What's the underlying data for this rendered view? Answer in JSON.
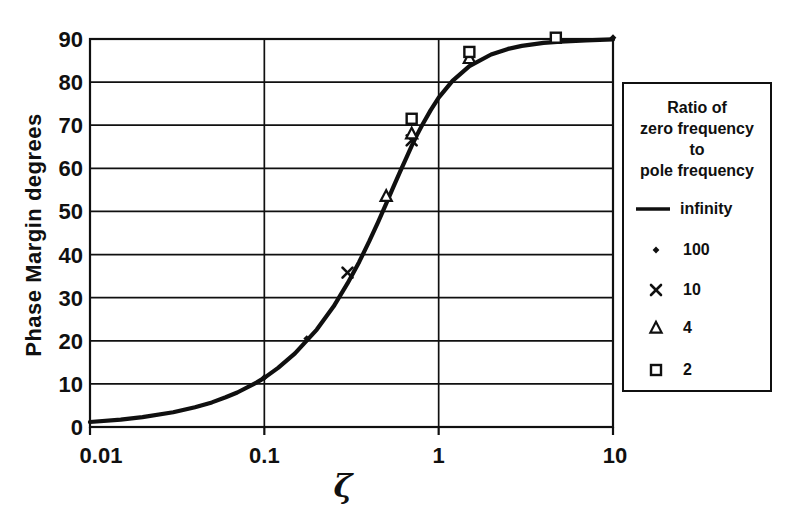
{
  "figure": {
    "background": "#ffffff",
    "ink": "#101010"
  },
  "y_axis": {
    "title": "Phase Margin degrees",
    "tick_labels": [
      "0",
      "10",
      "20",
      "30",
      "40",
      "50",
      "60",
      "70",
      "80",
      "90"
    ],
    "min": 0,
    "max": 90
  },
  "x_axis": {
    "title": "ζ",
    "tick_labels": [
      "0.01",
      "0.1",
      "1",
      "10"
    ],
    "scale": "log",
    "min": 0.01,
    "max": 10
  },
  "legend": {
    "title_lines": [
      "Ratio of",
      "zero frequency",
      "to",
      "pole frequency"
    ],
    "entries": [
      {
        "marker": "line",
        "label": "infinity"
      },
      {
        "marker": "dot",
        "label": "100"
      },
      {
        "marker": "cross",
        "label": "10"
      },
      {
        "marker": "triangle",
        "label": "4"
      },
      {
        "marker": "square",
        "label": "2"
      }
    ]
  },
  "chart_data": {
    "type": "line",
    "title": "",
    "xlabel": "ζ",
    "ylabel": "Phase Margin degrees",
    "x_scale": "log",
    "xlim": [
      0.01,
      10
    ],
    "ylim": [
      0,
      90
    ],
    "x_ticks": [
      0.01,
      0.1,
      1,
      10
    ],
    "y_ticks": [
      0,
      10,
      20,
      30,
      40,
      50,
      60,
      70,
      80,
      90
    ],
    "grid": true,
    "legend_position": "right",
    "series": [
      {
        "name": "infinity",
        "type": "line",
        "marker": "none",
        "points": [
          [
            0.01,
            1.15
          ],
          [
            0.015,
            1.7
          ],
          [
            0.02,
            2.3
          ],
          [
            0.03,
            3.4
          ],
          [
            0.04,
            4.6
          ],
          [
            0.05,
            5.7
          ],
          [
            0.06,
            6.9
          ],
          [
            0.07,
            8.0
          ],
          [
            0.09,
            10.3
          ],
          [
            0.1,
            11.4
          ],
          [
            0.12,
            13.7
          ],
          [
            0.15,
            17.1
          ],
          [
            0.2,
            22.6
          ],
          [
            0.25,
            28.0
          ],
          [
            0.3,
            33.3
          ],
          [
            0.35,
            38.3
          ],
          [
            0.4,
            43.1
          ],
          [
            0.45,
            47.6
          ],
          [
            0.5,
            51.8
          ],
          [
            0.55,
            55.7
          ],
          [
            0.6,
            59.2
          ],
          [
            0.65,
            62.3
          ],
          [
            0.7,
            65.2
          ],
          [
            0.75,
            67.7
          ],
          [
            0.8,
            69.9
          ],
          [
            0.9,
            73.5
          ],
          [
            1.0,
            76.4
          ],
          [
            1.2,
            80.3
          ],
          [
            1.5,
            83.7
          ],
          [
            2,
            86.4
          ],
          [
            2.5,
            87.7
          ],
          [
            3,
            88.4
          ],
          [
            4,
            89.1
          ],
          [
            5,
            89.4
          ],
          [
            7,
            89.7
          ],
          [
            10,
            89.9
          ]
        ]
      },
      {
        "name": "100",
        "type": "scatter",
        "marker": "dot",
        "points": [
          [
            0.1,
            11.5
          ],
          [
            0.175,
            20.5
          ],
          [
            10,
            90.3
          ]
        ]
      },
      {
        "name": "10",
        "type": "scatter",
        "marker": "cross",
        "points": [
          [
            0.3,
            35.8
          ],
          [
            0.7,
            66.5
          ]
        ]
      },
      {
        "name": "4",
        "type": "scatter",
        "marker": "triangle",
        "points": [
          [
            0.5,
            53.5
          ],
          [
            0.7,
            68.0
          ],
          [
            1.5,
            85.5
          ]
        ]
      },
      {
        "name": "2",
        "type": "scatter",
        "marker": "square",
        "points": [
          [
            0.7,
            71.5
          ],
          [
            1.5,
            87.0
          ],
          [
            4.7,
            90.3
          ]
        ]
      }
    ]
  }
}
